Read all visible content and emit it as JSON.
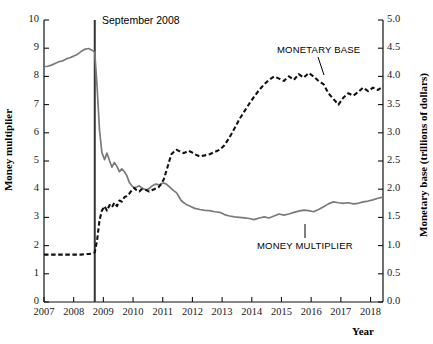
{
  "chart_data": {
    "type": "line",
    "title": "",
    "xlabel": "Year",
    "ylabel_left": "Money multiplier",
    "ylabel_right": "Monetary base (trillions of dollars)",
    "grid": false,
    "legend_position": "inline-annotations",
    "xlim": [
      2007.0,
      2018.42
    ],
    "ylim_left": [
      0,
      10
    ],
    "ylim_right": [
      0.0,
      5.0
    ],
    "xticks": [
      "2007",
      "2008",
      "2009",
      "2010",
      "2011",
      "2012",
      "2013",
      "2014",
      "2015",
      "2016",
      "2017",
      "2018"
    ],
    "yticks_left": [
      "0",
      "1",
      "2",
      "3",
      "4",
      "5",
      "6",
      "7",
      "8",
      "9",
      "10"
    ],
    "yticks_right": [
      "0.0",
      "0.5",
      "1.0",
      "1.5",
      "2.0",
      "2.5",
      "3.0",
      "3.5",
      "4.0",
      "4.5",
      "5.0"
    ],
    "annotations": [
      {
        "name": "september-2008-line",
        "text": "September 2008",
        "x": 2008.71,
        "type": "vertical-line"
      }
    ],
    "series": [
      {
        "name": "MONEY MULTIPLIER",
        "axis": "left",
        "style": "solid",
        "color": "#7a7a7a",
        "label_x": 2014.1,
        "label_y": 2.5,
        "x": [
          2007.0,
          2007.12,
          2007.25,
          2007.37,
          2007.5,
          2007.62,
          2007.75,
          2007.87,
          2008.0,
          2008.12,
          2008.25,
          2008.37,
          2008.5,
          2008.62,
          2008.71,
          2008.79,
          2008.87,
          2008.95,
          2009.04,
          2009.12,
          2009.21,
          2009.29,
          2009.37,
          2009.46,
          2009.54,
          2009.62,
          2009.71,
          2009.79,
          2009.87,
          2009.96,
          2010.04,
          2010.12,
          2010.21,
          2010.29,
          2010.37,
          2010.46,
          2010.54,
          2010.62,
          2010.71,
          2010.79,
          2010.87,
          2010.96,
          2011.04,
          2011.12,
          2011.21,
          2011.29,
          2011.37,
          2011.46,
          2011.54,
          2011.62,
          2011.71,
          2011.79,
          2011.87,
          2011.96,
          2012.08,
          2012.25,
          2012.42,
          2012.58,
          2012.75,
          2012.92,
          2013.08,
          2013.25,
          2013.42,
          2013.58,
          2013.75,
          2013.92,
          2014.08,
          2014.25,
          2014.42,
          2014.58,
          2014.75,
          2014.92,
          2015.08,
          2015.25,
          2015.42,
          2015.58,
          2015.75,
          2015.92,
          2016.08,
          2016.25,
          2016.42,
          2016.58,
          2016.75,
          2016.92,
          2017.08,
          2017.25,
          2017.42,
          2017.58,
          2017.75,
          2017.92,
          2018.08,
          2018.25,
          2018.42
        ],
        "values": [
          8.35,
          8.36,
          8.4,
          8.46,
          8.52,
          8.55,
          8.62,
          8.66,
          8.72,
          8.78,
          8.88,
          8.96,
          8.99,
          8.93,
          8.85,
          7.6,
          6.1,
          5.3,
          5.05,
          5.28,
          5.0,
          4.78,
          4.95,
          4.8,
          4.62,
          4.72,
          4.62,
          4.48,
          4.25,
          4.12,
          4.05,
          4.08,
          4.12,
          4.05,
          4.0,
          3.98,
          4.02,
          4.1,
          4.16,
          4.18,
          4.15,
          4.2,
          4.22,
          4.18,
          4.1,
          4.02,
          3.95,
          3.88,
          3.74,
          3.6,
          3.52,
          3.46,
          3.42,
          3.38,
          3.32,
          3.28,
          3.25,
          3.24,
          3.2,
          3.18,
          3.1,
          3.05,
          3.02,
          3.0,
          2.98,
          2.96,
          2.92,
          2.98,
          3.02,
          2.98,
          3.05,
          3.12,
          3.08,
          3.12,
          3.18,
          3.22,
          3.26,
          3.24,
          3.2,
          3.28,
          3.38,
          3.48,
          3.55,
          3.52,
          3.5,
          3.52,
          3.48,
          3.5,
          3.55,
          3.58,
          3.62,
          3.68,
          3.72
        ]
      },
      {
        "name": "MONETARY BASE",
        "axis": "right",
        "style": "dashed",
        "color": "#111111",
        "label_x": 2015.4,
        "label_y": 4.55,
        "x": [
          2007.0,
          2007.12,
          2007.25,
          2007.37,
          2007.5,
          2007.62,
          2007.75,
          2007.87,
          2008.0,
          2008.12,
          2008.25,
          2008.37,
          2008.5,
          2008.62,
          2008.71,
          2008.79,
          2008.87,
          2008.95,
          2009.04,
          2009.12,
          2009.21,
          2009.29,
          2009.37,
          2009.46,
          2009.54,
          2009.62,
          2009.71,
          2009.79,
          2009.87,
          2009.96,
          2010.04,
          2010.12,
          2010.21,
          2010.29,
          2010.37,
          2010.46,
          2010.54,
          2010.62,
          2010.71,
          2010.79,
          2010.87,
          2010.96,
          2011.04,
          2011.12,
          2011.21,
          2011.29,
          2011.37,
          2011.46,
          2011.54,
          2011.62,
          2011.71,
          2011.79,
          2011.87,
          2011.96,
          2012.08,
          2012.25,
          2012.42,
          2012.58,
          2012.75,
          2012.92,
          2013.08,
          2013.25,
          2013.42,
          2013.58,
          2013.75,
          2013.92,
          2014.08,
          2014.25,
          2014.42,
          2014.58,
          2014.75,
          2014.92,
          2015.08,
          2015.25,
          2015.42,
          2015.58,
          2015.75,
          2015.92,
          2016.08,
          2016.25,
          2016.42,
          2016.58,
          2016.75,
          2016.92,
          2017.08,
          2017.25,
          2017.42,
          2017.58,
          2017.75,
          2017.92,
          2018.08,
          2018.25,
          2018.42
        ],
        "values": [
          0.84,
          0.84,
          0.84,
          0.84,
          0.84,
          0.84,
          0.84,
          0.84,
          0.84,
          0.84,
          0.84,
          0.85,
          0.85,
          0.86,
          0.88,
          1.1,
          1.45,
          1.62,
          1.7,
          1.62,
          1.72,
          1.68,
          1.76,
          1.7,
          1.8,
          1.78,
          1.86,
          1.88,
          1.92,
          1.98,
          2.02,
          1.98,
          1.96,
          2.0,
          2.0,
          1.98,
          1.96,
          1.98,
          2.0,
          2.02,
          2.04,
          2.1,
          2.18,
          2.32,
          2.48,
          2.62,
          2.66,
          2.7,
          2.68,
          2.66,
          2.64,
          2.66,
          2.68,
          2.66,
          2.62,
          2.58,
          2.6,
          2.62,
          2.66,
          2.7,
          2.78,
          2.92,
          3.08,
          3.24,
          3.38,
          3.52,
          3.64,
          3.76,
          3.86,
          3.94,
          4.0,
          3.96,
          3.92,
          4.0,
          3.94,
          4.04,
          3.98,
          4.06,
          4.0,
          3.92,
          3.86,
          3.7,
          3.6,
          3.5,
          3.62,
          3.7,
          3.66,
          3.72,
          3.8,
          3.74,
          3.8,
          3.76,
          3.82
        ]
      }
    ]
  },
  "style": {
    "axis_color": "#111111",
    "background": "#ffffff",
    "money_multiplier_color": "#7a7a7a",
    "monetary_base_color": "#111111",
    "event_line_color": "#333333"
  }
}
